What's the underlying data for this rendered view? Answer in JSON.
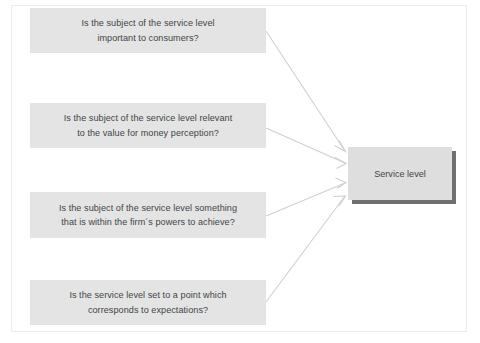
{
  "diagram": {
    "type": "convergent-arrow-diagram",
    "questions": [
      {
        "id": "q1",
        "text": "Is the subject of the service level important to consumers?",
        "line1": "Is the subject of the service level",
        "line2": "important to consumers?"
      },
      {
        "id": "q2",
        "text": "Is the subject of the service level relevant to the value for money perception?",
        "line1": "Is the subject of the service level relevant",
        "line2": "to the value for money perception?"
      },
      {
        "id": "q3",
        "text": "Is the subject of the service level something that is within the firm´s powers to achieve?",
        "line1": "Is the subject of the service level something",
        "line2": "that is within the firm´s powers to achieve?"
      },
      {
        "id": "q4",
        "text": "Is the service level set to a point which corresponds to expectations?",
        "line1": "Is the service level set to a point which",
        "line2": "corresponds to expectations?"
      }
    ],
    "target": {
      "label": "Service level"
    },
    "colors": {
      "question_box_fill": "#e4e4e4",
      "target_box_fill": "#dedede",
      "target_box_shadow": "#6f6f6f",
      "text": "#3f4548",
      "connector_line": "#cfcfcf",
      "page_border": "#ececec",
      "background": "#ffffff"
    }
  }
}
